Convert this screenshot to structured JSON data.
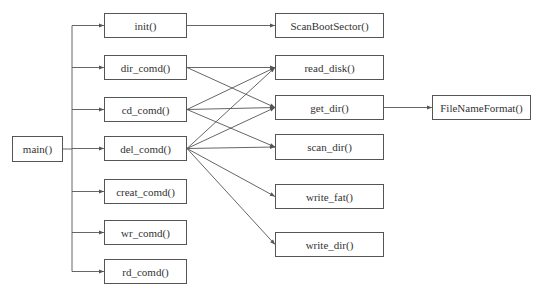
{
  "diagram": {
    "type": "call-graph",
    "colors": {
      "line": "#555555",
      "text": "#333333",
      "background": "#ffffff"
    },
    "nodes": [
      {
        "id": "main",
        "label": "main()",
        "x": 12,
        "y": 136,
        "w": 51,
        "h": 26
      },
      {
        "id": "init",
        "label": "init()",
        "x": 104,
        "y": 13,
        "w": 83,
        "h": 25
      },
      {
        "id": "dir_comd",
        "label": "dir_comd()",
        "x": 104,
        "y": 55,
        "w": 83,
        "h": 25
      },
      {
        "id": "cd_comd",
        "label": "cd_comd()",
        "x": 104,
        "y": 97,
        "w": 83,
        "h": 25
      },
      {
        "id": "del_comd",
        "label": "del_comd()",
        "x": 104,
        "y": 136,
        "w": 83,
        "h": 25
      },
      {
        "id": "creat_comd",
        "label": "creat_comd()",
        "x": 104,
        "y": 179,
        "w": 83,
        "h": 25
      },
      {
        "id": "wr_comd",
        "label": "wr_comd()",
        "x": 104,
        "y": 220,
        "w": 83,
        "h": 25
      },
      {
        "id": "rd_comd",
        "label": "rd_comd()",
        "x": 104,
        "y": 259,
        "w": 83,
        "h": 25
      },
      {
        "id": "ScanBootSector",
        "label": "ScanBootSector()",
        "x": 275,
        "y": 13,
        "w": 109,
        "h": 25
      },
      {
        "id": "read_disk",
        "label": "read_disk()",
        "x": 275,
        "y": 55,
        "w": 109,
        "h": 25
      },
      {
        "id": "get_dir",
        "label": "get_dir()",
        "x": 275,
        "y": 95,
        "w": 109,
        "h": 25
      },
      {
        "id": "scan_dir",
        "label": "scan_dir()",
        "x": 275,
        "y": 134,
        "w": 109,
        "h": 26
      },
      {
        "id": "write_fat",
        "label": "write_fat()",
        "x": 275,
        "y": 184,
        "w": 109,
        "h": 25
      },
      {
        "id": "write_dir",
        "label": "write_dir()",
        "x": 275,
        "y": 232,
        "w": 109,
        "h": 25
      },
      {
        "id": "FileNameFormat",
        "label": "FileNameFormat()",
        "x": 432,
        "y": 95,
        "w": 99,
        "h": 25
      }
    ],
    "trunk": {
      "from": "main",
      "x": 72,
      "children": [
        "init",
        "dir_comd",
        "cd_comd",
        "del_comd",
        "creat_comd",
        "wr_comd",
        "rd_comd"
      ]
    },
    "edges": [
      {
        "from": "init",
        "to": "ScanBootSector"
      },
      {
        "from": "dir_comd",
        "to": "read_disk"
      },
      {
        "from": "dir_comd",
        "to": "get_dir"
      },
      {
        "from": "cd_comd",
        "to": "read_disk"
      },
      {
        "from": "cd_comd",
        "to": "get_dir"
      },
      {
        "from": "cd_comd",
        "to": "scan_dir"
      },
      {
        "from": "del_comd",
        "to": "read_disk"
      },
      {
        "from": "del_comd",
        "to": "get_dir"
      },
      {
        "from": "del_comd",
        "to": "scan_dir"
      },
      {
        "from": "del_comd",
        "to": "write_fat"
      },
      {
        "from": "del_comd",
        "to": "write_dir"
      },
      {
        "from": "get_dir",
        "to": "FileNameFormat"
      }
    ]
  }
}
